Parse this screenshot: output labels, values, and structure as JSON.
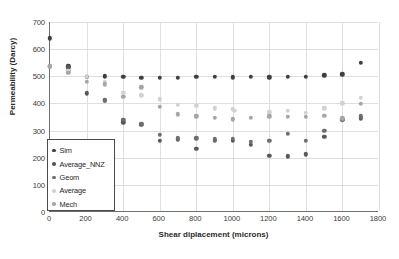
{
  "chart_data": {
    "type": "scatter",
    "title": "",
    "xlabel": "Shear diplacement (microns)",
    "ylabel": "Permeability (Darcy)",
    "xlim": [
      0,
      1800
    ],
    "ylim": [
      0,
      700
    ],
    "xticks": [
      0,
      200,
      400,
      600,
      800,
      1000,
      1200,
      1400,
      1600,
      1800
    ],
    "yticks": [
      0,
      100,
      200,
      300,
      400,
      500,
      600,
      700
    ],
    "grid": true,
    "legend_position": "inside-lower-left",
    "series": [
      {
        "name": "Sim",
        "color": "#3f3f3f",
        "x": [
          0,
          100,
          200,
          300,
          400,
          500,
          600,
          700,
          800,
          900,
          1000,
          1100,
          1200,
          1300,
          1400,
          1500,
          1600,
          1700
        ],
        "y": [
          640,
          537,
          497,
          500,
          497,
          494,
          495,
          495,
          497,
          497,
          496,
          497,
          496,
          497,
          499,
          503,
          507,
          550
        ]
      },
      {
        "name": "Average_NNZ",
        "color": "#585858",
        "x": [
          0,
          100,
          200,
          300,
          400,
          500,
          600,
          700,
          800,
          900,
          1000,
          1100,
          1200,
          1300,
          1400,
          1500,
          1600,
          1700
        ],
        "y": [
          537,
          533,
          437,
          412,
          330,
          322,
          262,
          265,
          232,
          263,
          262,
          247,
          208,
          205,
          212,
          278,
          340,
          345
        ]
      },
      {
        "name": "Geom",
        "color": "#6e6e6e",
        "x": [
          0,
          100,
          200,
          300,
          400,
          500,
          600,
          700,
          800,
          900,
          1000,
          1100,
          1200,
          1300,
          1400,
          1500,
          1600,
          1700
        ],
        "y": [
          537,
          520,
          497,
          412,
          340,
          325,
          285,
          272,
          272,
          268,
          270,
          258,
          262,
          288,
          262,
          300,
          340,
          352
        ]
      },
      {
        "name": "Average",
        "color": "#d2d2d2",
        "x": [
          0,
          100,
          200,
          300,
          400,
          500,
          600,
          700,
          800,
          900,
          1000,
          1010,
          1200,
          1300,
          1400,
          1500,
          1600,
          1700
        ],
        "y": [
          537,
          520,
          497,
          480,
          440,
          430,
          415,
          395,
          392,
          382,
          378,
          372,
          368,
          372,
          365,
          382,
          400,
          420
        ]
      },
      {
        "name": "Mech",
        "color": "#a6a6a6",
        "x": [
          0,
          100,
          200,
          300,
          400,
          500,
          600,
          700,
          800,
          900,
          1000,
          1100,
          1200,
          1300,
          1400,
          1500,
          1600,
          1700
        ],
        "y": [
          537,
          512,
          480,
          470,
          425,
          460,
          388,
          360,
          352,
          347,
          342,
          347,
          352,
          350,
          350,
          355,
          345,
          398
        ]
      }
    ]
  },
  "legend": {
    "items": [
      {
        "label": "Sim",
        "color": "#3f3f3f"
      },
      {
        "label": "Average_NNZ",
        "color": "#585858"
      },
      {
        "label": "Geom",
        "color": "#6e6e6e"
      },
      {
        "label": "Average",
        "color": "#d2d2d2"
      },
      {
        "label": "Mech",
        "color": "#a6a6a6"
      }
    ]
  },
  "axes": {
    "y_title": "Permeability (Darcy)",
    "x_title": "Shear diplacement (microns)",
    "y_ticks": [
      "0",
      "100",
      "200",
      "300",
      "400",
      "500",
      "600",
      "700"
    ],
    "x_ticks": [
      "0",
      "200",
      "400",
      "600",
      "800",
      "1000",
      "1200",
      "1400",
      "1600",
      "1800"
    ]
  }
}
